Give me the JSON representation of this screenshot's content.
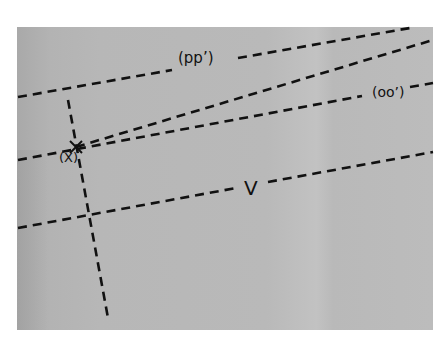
{
  "diagram": {
    "background_color": "#b9b9b9",
    "line_color": "#111111",
    "line_style": "dashed",
    "labels": {
      "pp": "(pp’)",
      "oo": "(oo’)",
      "x": "(X)",
      "v": "V"
    },
    "marker": {
      "name": "point-x",
      "symbol": "×",
      "x": 76,
      "y": 147
    },
    "lines": [
      {
        "name": "pp-line",
        "x1": 18,
        "y1": 97,
        "x2": 410,
        "y2": 28
      },
      {
        "name": "oo-line",
        "x1": 18,
        "y1": 160,
        "x2": 433,
        "y2": 83
      },
      {
        "name": "x-ray-line",
        "x1": 76,
        "y1": 147,
        "x2": 433,
        "y2": 40
      },
      {
        "name": "v-line",
        "x1": 18,
        "y1": 228,
        "x2": 433,
        "y2": 152
      },
      {
        "name": "vertical-line",
        "x1": 68,
        "y1": 100,
        "x2": 108,
        "y2": 318
      }
    ]
  }
}
